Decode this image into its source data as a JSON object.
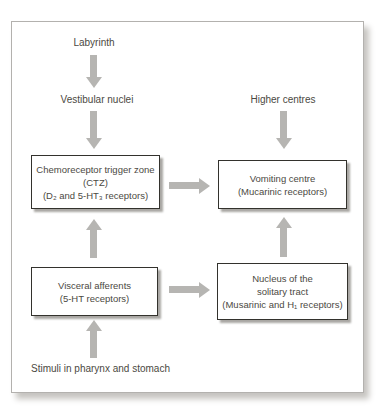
{
  "diagram": {
    "type": "flowchart",
    "nodes": {
      "labyrinth": {
        "label": "Labyrinth"
      },
      "vestibular_nuclei": {
        "label": "Vestibular nuclei"
      },
      "higher_centres": {
        "label": "Higher centres"
      },
      "ctz": {
        "lines": [
          "Chemoreceptor trigger zone",
          "(CTZ)",
          "(D₂ and 5-HT₃ receptors)"
        ]
      },
      "vomiting_centre": {
        "lines": [
          "Vomiting centre",
          "(Mucarinic receptors)"
        ]
      },
      "visceral_afferents": {
        "lines": [
          "Visceral afferents",
          "(5-HT receptors)"
        ]
      },
      "solitary_tract": {
        "lines": [
          "Nucleus of  the",
          "solitary tract",
          "(Musarinic and H₁ receptors)"
        ]
      },
      "stimuli": {
        "label": "Stimuli in pharynx and stomach"
      }
    },
    "edges": [
      {
        "from": "Labyrinth",
        "to": "Vestibular nuclei",
        "direction": "down"
      },
      {
        "from": "Vestibular nuclei",
        "to": "Chemoreceptor trigger zone (CTZ)",
        "direction": "down"
      },
      {
        "from": "Higher centres",
        "to": "Vomiting centre",
        "direction": "down"
      },
      {
        "from": "Chemoreceptor trigger zone (CTZ)",
        "to": "Vomiting centre",
        "direction": "right"
      },
      {
        "from": "Visceral afferents",
        "to": "Chemoreceptor trigger zone (CTZ)",
        "direction": "up"
      },
      {
        "from": "Visceral afferents",
        "to": "Nucleus of the solitary tract",
        "direction": "right"
      },
      {
        "from": "Nucleus of the solitary tract",
        "to": "Vomiting centre",
        "direction": "up"
      },
      {
        "from": "Stimuli in pharynx and stomach",
        "to": "Visceral afferents",
        "direction": "up"
      }
    ],
    "colors": {
      "arrow": "#b6b5b2",
      "box_border": "#33322d",
      "box_fill": "#ffffff",
      "box_shadow": "#a9a7a3",
      "text": "#4b4942",
      "frame_border": "#b3b1ae",
      "background": "#ffffff"
    }
  }
}
